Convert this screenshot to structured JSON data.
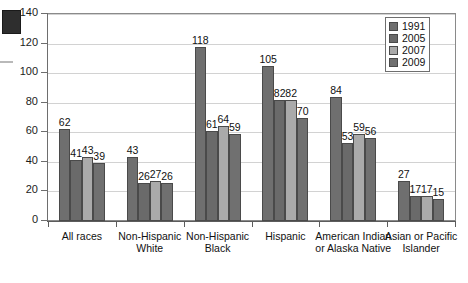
{
  "chart_data": {
    "type": "bar",
    "title": "",
    "subtitle": "",
    "xlabel": "",
    "ylabel": "",
    "ylim": [
      0,
      140
    ],
    "ytick_step": 20,
    "yticks": [
      "0",
      "20",
      "40",
      "60",
      "80",
      "100",
      "120",
      "140"
    ],
    "grid": true,
    "legend_position": "top-right",
    "categories": [
      "All races",
      "Non-Hispanic White",
      "Non-Hispanic Black",
      "Hispanic",
      "American Indian or Alaska Native",
      "Asian or Pacific Islander"
    ],
    "series": [
      {
        "name": "1991",
        "color": "#6f6f6f",
        "values": [
          62,
          43,
          118,
          105,
          84,
          27
        ]
      },
      {
        "name": "2005",
        "color": "#6a6a6a",
        "values": [
          41,
          26,
          61,
          82,
          53,
          17
        ]
      },
      {
        "name": "2007",
        "color": "#aaaaaa",
        "values": [
          43,
          27,
          64,
          82,
          59,
          17
        ]
      },
      {
        "name": "2009",
        "color": "#707070",
        "values": [
          39,
          26,
          59,
          70,
          56,
          15
        ]
      }
    ],
    "data_labels": true
  },
  "legend": {
    "items": [
      {
        "label": "1991"
      },
      {
        "label": "2005"
      },
      {
        "label": "2007"
      },
      {
        "label": "2009"
      }
    ]
  },
  "colors": {
    "grid": "#d2d2d2",
    "axis": "#6e6e6e",
    "text": "#111111",
    "plot_background": "#ffffff"
  }
}
